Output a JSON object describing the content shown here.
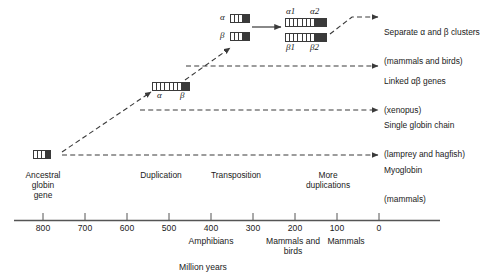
{
  "figure": {
    "title_caption": "Million years",
    "axis": {
      "label": "Million years",
      "ticks": [
        800,
        700,
        600,
        500,
        400,
        300,
        200,
        100,
        0
      ],
      "tick_labels": [
        "800",
        "700",
        "600",
        "500",
        "400",
        "300",
        "200",
        "100",
        "0"
      ],
      "direction": "descending",
      "range": [
        860,
        0
      ]
    },
    "era_labels": [
      {
        "id": "amphibians",
        "text": "Amphibians",
        "at": 400
      },
      {
        "id": "mammals-and-birds",
        "text": "Mammals and\nbirds",
        "at": 200
      },
      {
        "id": "mammals",
        "text": "Mammals",
        "at": 100
      }
    ],
    "stages": [
      {
        "id": "ancestral-globin-gene",
        "text": "Ancestral\nglobin\ngene"
      },
      {
        "id": "duplication",
        "text": "Duplication"
      },
      {
        "id": "transposition",
        "text": "Transposition"
      },
      {
        "id": "more-duplications",
        "text": "More\nduplications"
      }
    ],
    "gene_labels": {
      "alpha": "α",
      "beta": "β",
      "alpha1": "α1",
      "alpha2": "α2",
      "beta1": "β1",
      "beta2": "β2"
    },
    "outcomes": [
      {
        "id": "separate-clusters",
        "line1": "Separate α and β clusters",
        "line2": "(mammals and birds)"
      },
      {
        "id": "linked-genes",
        "line1": "Linked αβ genes",
        "line2": "(xenopus)"
      },
      {
        "id": "single-globin-chain",
        "line1": "Single globin chain",
        "line2": "(lamprey and hagfish)"
      },
      {
        "id": "myoglobin",
        "line1": "Myoglobin",
        "line2": "(mammals)"
      }
    ],
    "colors": {
      "ink": "#1a1a1a",
      "gene_block": "#3a3a3a",
      "axis": "#555555",
      "background": "#ffffff"
    }
  }
}
